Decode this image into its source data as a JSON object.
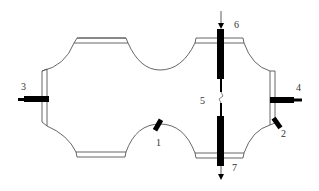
{
  "diagram": {
    "type": "schematic",
    "colors": {
      "stroke": "#555555",
      "solid": "#000000",
      "label": "#333333",
      "background": "#ffffff"
    },
    "labels": {
      "l1": "1",
      "l2": "2",
      "l3": "3",
      "l4": "4",
      "l5": "5",
      "l6": "6",
      "l7": "7"
    },
    "components": [
      {
        "id": "1",
        "name": "small tilted element on lower middle curve"
      },
      {
        "id": "2",
        "name": "small tilted element on lower right corner"
      },
      {
        "id": "3",
        "name": "left horizontal bar"
      },
      {
        "id": "4",
        "name": "right horizontal bar"
      },
      {
        "id": "5",
        "name": "gap between vertical rods"
      },
      {
        "id": "6",
        "name": "upper vertical rod with downward arrow"
      },
      {
        "id": "7",
        "name": "lower vertical rod with downward arrow"
      }
    ]
  }
}
